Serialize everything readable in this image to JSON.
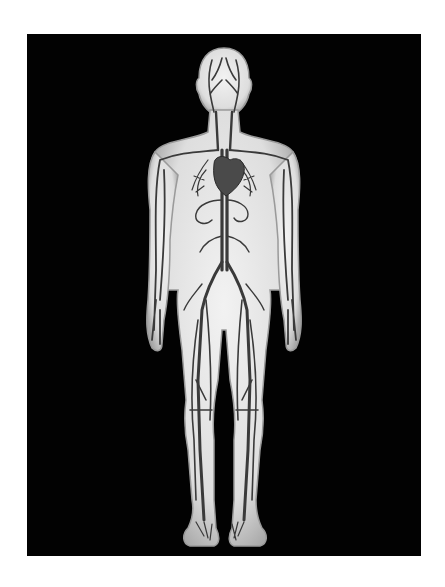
{
  "image": {
    "subject": "human circulatory system illustration",
    "view": "anterior full body",
    "caption": "Human circulatory system"
  },
  "colors": {
    "page_background": "#ffffff",
    "panel_background": "#020202",
    "body_fill": "#e6e6e6",
    "body_edge": "#b5b5b5",
    "vessel": "#3a3a3a",
    "heart": "#4a4a4a"
  }
}
